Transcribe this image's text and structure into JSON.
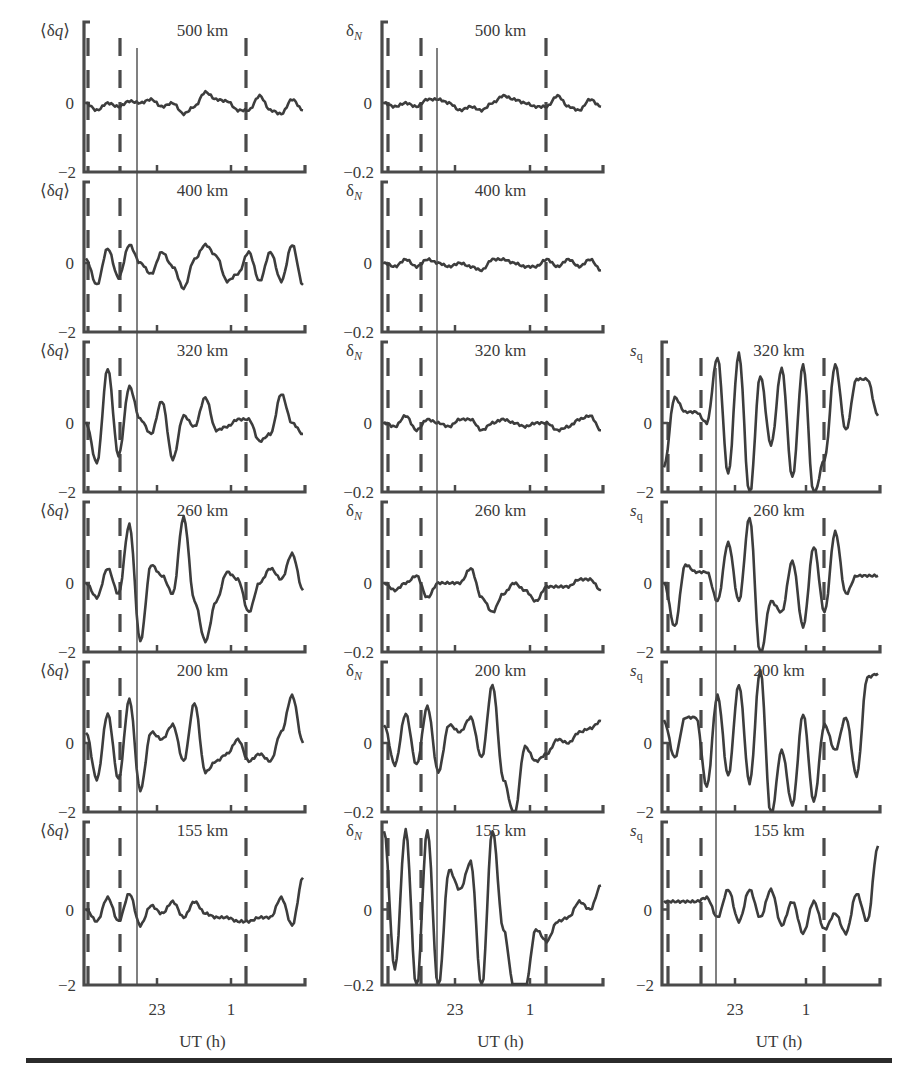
{
  "figure": {
    "columns": [
      {
        "id": "dq",
        "ylabel": "⟨δq⟩",
        "ytick_top_blank": true,
        "ytick_zero": "0",
        "ytick_bottom": "−2",
        "ylim": [
          -2,
          2
        ]
      },
      {
        "id": "dN",
        "ylabel": "δN",
        "ylabel_base": "δ",
        "ylabel_sub": "N",
        "ytick_zero": "0",
        "ytick_bottom": "−0.2",
        "ylim": [
          -0.2,
          0.2
        ]
      },
      {
        "id": "sq",
        "ylabel": "sq",
        "ylabel_base": "s",
        "ylabel_sub": "q",
        "ytick_zero": "0",
        "ytick_bottom": "−2",
        "ylim": [
          -2,
          2
        ]
      }
    ],
    "xlabel": "UT (h)",
    "xticks": [
      "23",
      "1"
    ],
    "altitudes": [
      "500 km",
      "400 km",
      "320 km",
      "260 km",
      "200 km",
      "155 km"
    ],
    "line_color": "#3d3d3d",
    "axis_color": "#4a4a4a"
  },
  "chart_data": {
    "type": "line",
    "title": "",
    "layout": "6 rows (altitudes) × 3 columns (⟨δq⟩, δN, sq); sq column only for 320–155 km",
    "xlabel": "UT (h)",
    "x_tick_labels": [
      "23",
      "1"
    ],
    "x_range_approx_h": [
      20.8,
      3.2
    ],
    "markers": {
      "dashed_vertical_lines_UT_approx": [
        21.0,
        21.9,
        1.5
      ],
      "solid_vertical_line_UT_approx": 22.4
    },
    "x": [
      0,
      0.05,
      0.1,
      0.15,
      0.2,
      0.25,
      0.3,
      0.35,
      0.4,
      0.45,
      0.5,
      0.55,
      0.6,
      0.65,
      0.7,
      0.75,
      0.8,
      0.85,
      0.9,
      0.95,
      1.0
    ],
    "panels": [
      {
        "column": "⟨δq⟩",
        "altitude": "500 km",
        "ylim": [
          -2,
          2
        ],
        "values": [
          0,
          -0.2,
          0,
          -0.1,
          0.05,
          0,
          0.1,
          -0.1,
          0,
          -0.3,
          -0.1,
          0.3,
          0.1,
          0.05,
          -0.2,
          -0.2,
          0.2,
          -0.2,
          -0.3,
          0.1,
          -0.2
        ]
      },
      {
        "column": "⟨δq⟩",
        "altitude": "400 km",
        "ylim": [
          -2,
          2
        ],
        "values": [
          0.1,
          -0.6,
          0.4,
          -0.4,
          0.5,
          0,
          -0.3,
          0.3,
          -0.1,
          -0.7,
          0.1,
          0.5,
          0.2,
          -0.5,
          -0.3,
          0.3,
          -0.5,
          0.3,
          -0.5,
          0.5,
          -0.6
        ]
      },
      {
        "column": "⟨δq⟩",
        "altitude": "320 km",
        "ylim": [
          -2,
          2
        ],
        "values": [
          0,
          -1.1,
          1.5,
          -0.9,
          1.0,
          0.1,
          -0.3,
          0.6,
          -1.0,
          0.2,
          -0.1,
          0.7,
          -0.2,
          -0.1,
          0.1,
          0.1,
          -0.5,
          -0.3,
          0.8,
          0.0,
          -0.3
        ]
      },
      {
        "column": "⟨δq⟩",
        "altitude": "260 km",
        "ylim": [
          -2,
          2
        ],
        "values": [
          0,
          -0.4,
          0.4,
          -0.3,
          1.6,
          -1.6,
          0.5,
          0.2,
          -0.3,
          1.8,
          -0.5,
          -1.6,
          -0.5,
          0.3,
          0.1,
          -0.8,
          0,
          0.4,
          0.1,
          0.8,
          -0.2
        ]
      },
      {
        "column": "⟨δq⟩",
        "altitude": "200 km",
        "ylim": [
          -2,
          2
        ],
        "values": [
          0.3,
          -1.0,
          0.8,
          -1.0,
          1.2,
          -1.3,
          0.3,
          0.1,
          0.5,
          -0.5,
          1.1,
          -0.8,
          -0.5,
          -0.3,
          0.1,
          -0.5,
          -0.3,
          -0.5,
          0.3,
          1.3,
          0.0
        ]
      },
      {
        "column": "⟨δq⟩",
        "altitude": "155 km",
        "ylim": [
          -2,
          2
        ],
        "values": [
          0,
          -0.3,
          0.3,
          -0.3,
          0.4,
          -0.4,
          0.1,
          -0.1,
          0.2,
          -0.2,
          0.2,
          -0.1,
          -0.2,
          -0.2,
          -0.3,
          -0.3,
          -0.2,
          -0.2,
          0.3,
          -0.4,
          0.8
        ]
      },
      {
        "column": "δN",
        "altitude": "500 km",
        "ylim": [
          -0.2,
          0.2
        ],
        "values": [
          0,
          -0.01,
          0,
          -0.01,
          0.01,
          0.01,
          0,
          -0.02,
          -0.01,
          -0.02,
          0,
          0.02,
          0.01,
          0,
          -0.01,
          -0.01,
          0.02,
          -0.01,
          -0.02,
          0.01,
          -0.01
        ]
      },
      {
        "column": "δN",
        "altitude": "400 km",
        "ylim": [
          -0.2,
          0.2
        ],
        "values": [
          0,
          -0.01,
          0.01,
          -0.01,
          0.01,
          0,
          -0.01,
          0,
          -0.01,
          -0.02,
          0.01,
          0.01,
          0,
          -0.01,
          -0.01,
          0.01,
          -0.01,
          0.01,
          -0.01,
          0.01,
          -0.02
        ]
      },
      {
        "column": "δN",
        "altitude": "320 km",
        "ylim": [
          -0.2,
          0.2
        ],
        "values": [
          0,
          -0.01,
          0.02,
          -0.02,
          0.01,
          0,
          -0.01,
          0.01,
          0.01,
          -0.02,
          0,
          0.01,
          0,
          -0.01,
          0,
          0,
          -0.02,
          -0.01,
          0.01,
          0.02,
          -0.02
        ]
      },
      {
        "column": "δN",
        "altitude": "260 km",
        "ylim": [
          -0.2,
          0.2
        ],
        "values": [
          0,
          -0.02,
          0,
          0.02,
          -0.04,
          0,
          0,
          0.0,
          0.04,
          -0.04,
          -0.08,
          -0.03,
          0,
          -0.02,
          -0.05,
          -0.01,
          -0.01,
          -0.01,
          0.01,
          0.01,
          -0.02
        ]
      },
      {
        "column": "δN",
        "altitude": "200 km",
        "ylim": [
          -0.2,
          0.2
        ],
        "values": [
          0.05,
          -0.06,
          0.08,
          -0.06,
          0.1,
          -0.08,
          0.05,
          0.03,
          0.07,
          -0.04,
          0.16,
          -0.1,
          -0.2,
          -0.01,
          -0.05,
          -0.03,
          0.01,
          0.0,
          0.03,
          0.04,
          0.06
        ]
      },
      {
        "column": "δN",
        "altitude": "155 km",
        "ylim": [
          -0.2,
          0.2
        ],
        "values": [
          0.2,
          -0.15,
          0.2,
          -0.2,
          0.2,
          -0.2,
          0.1,
          0.05,
          0.12,
          -0.2,
          0.2,
          -0.05,
          -0.2,
          -0.2,
          -0.05,
          -0.08,
          -0.03,
          -0.02,
          0.02,
          0.0,
          0.06
        ]
      },
      {
        "column": "sq",
        "altitude": "320 km",
        "ylim": [
          -2,
          2
        ],
        "values": [
          -1.2,
          0.7,
          0.3,
          0.3,
          0.0,
          1.8,
          -1.4,
          1.9,
          -2.0,
          1.3,
          -0.6,
          1.5,
          -1.5,
          1.6,
          -2.0,
          -1.0,
          1.6,
          -0.2,
          1.2,
          1.2,
          0.2
        ]
      },
      {
        "column": "sq",
        "altitude": "260 km",
        "ylim": [
          -2,
          2
        ],
        "values": [
          0,
          -1.2,
          0.5,
          0.3,
          0.3,
          -0.5,
          1.1,
          -0.5,
          1.8,
          -2.0,
          -0.5,
          -0.8,
          0.6,
          -1.2,
          1.0,
          -0.8,
          1.4,
          -0.3,
          0.2,
          0.2,
          0.2
        ]
      },
      {
        "column": "sq",
        "altitude": "200 km",
        "ylim": [
          -2,
          2
        ],
        "values": [
          0.6,
          -0.4,
          0.7,
          0.7,
          -1.2,
          1.3,
          -0.9,
          1.6,
          -1.1,
          2.0,
          -2.0,
          -0.2,
          -1.7,
          0.8,
          -1.6,
          0.5,
          -0.2,
          0.7,
          -0.9,
          1.8,
          1.9
        ]
      },
      {
        "column": "sq",
        "altitude": "155 km",
        "ylim": [
          -2,
          2
        ],
        "values": [
          0.2,
          0.2,
          0.2,
          0.2,
          0.3,
          -0.2,
          0.5,
          -0.3,
          0.5,
          -0.2,
          0.5,
          -0.4,
          0.2,
          -0.6,
          0.2,
          -0.5,
          -0.1,
          -0.6,
          0.4,
          -0.3,
          1.6
        ]
      }
    ]
  }
}
